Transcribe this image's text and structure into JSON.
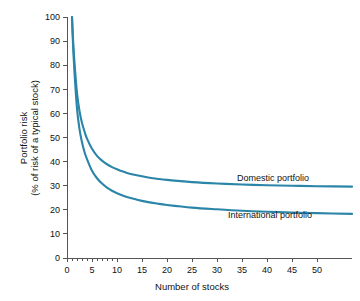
{
  "chart_data": {
    "type": "line",
    "title": "",
    "xlabel": "Number of stocks",
    "ylabel_line1": "Portfolio risk",
    "ylabel_line2": "(% of risk of a typical stock)",
    "xlim": [
      0,
      57
    ],
    "ylim": [
      0,
      100
    ],
    "xticks": [
      0,
      5,
      10,
      15,
      20,
      25,
      30,
      35,
      40,
      45,
      50
    ],
    "xtick_labels": [
      "0",
      "5",
      "10",
      "15",
      "20",
      "25",
      "30",
      "35",
      "40",
      "45",
      "50"
    ],
    "x_minor_ticks": [
      1,
      2,
      3,
      4,
      6,
      7,
      8,
      9
    ],
    "yticks": [
      0,
      10,
      20,
      30,
      40,
      50,
      60,
      70,
      80,
      90,
      100
    ],
    "ytick_labels": [
      "0",
      "10",
      "20",
      "30",
      "40",
      "50",
      "60",
      "70",
      "80",
      "90",
      "100"
    ],
    "grid": false,
    "legend_position": "inline-annotation",
    "line_color": "#2b85a8",
    "series": [
      {
        "name": "Domestic portfolio",
        "annotation": "Domestic portfolio",
        "asymptote": 29.5,
        "x": [
          1,
          1.2,
          1.5,
          2,
          2.5,
          3,
          3.5,
          4,
          5,
          6,
          7,
          8,
          9,
          10,
          12,
          14,
          16,
          18,
          20,
          25,
          30,
          35,
          40,
          45,
          50,
          57
        ],
        "values": [
          100,
          91,
          81,
          68.5,
          61,
          56,
          52.5,
          49.5,
          45.3,
          42.4,
          40.4,
          38.9,
          37.7,
          36.8,
          35.3,
          34.3,
          33.5,
          32.9,
          32.4,
          31.5,
          30.9,
          30.5,
          30.2,
          30.0,
          29.8,
          29.6
        ]
      },
      {
        "name": "International portfolio",
        "annotation": "International portfolio",
        "asymptote": 14.5,
        "x": [
          1,
          1.2,
          1.5,
          2,
          2.5,
          3,
          3.5,
          4,
          5,
          6,
          7,
          8,
          9,
          10,
          12,
          14,
          16,
          18,
          20,
          25,
          30,
          35,
          40,
          45,
          50,
          57
        ],
        "values": [
          100,
          89,
          77,
          62,
          53.5,
          48,
          44,
          41,
          36.2,
          33.1,
          30.9,
          29.2,
          27.9,
          26.9,
          25.3,
          24.2,
          23.3,
          22.6,
          22.0,
          20.9,
          20.2,
          19.6,
          19.2,
          18.9,
          18.6,
          18.3
        ]
      }
    ]
  }
}
